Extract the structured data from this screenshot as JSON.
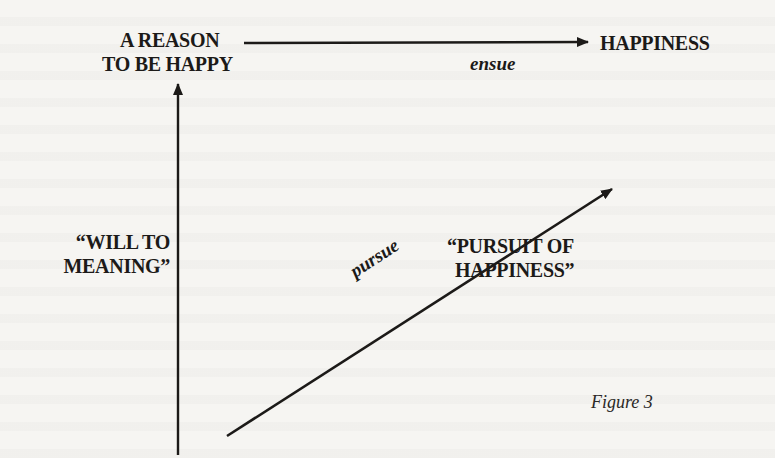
{
  "diagram": {
    "nodes": {
      "reason": {
        "line1": "A REASON",
        "line2": "TO BE HAPPY"
      },
      "happiness": {
        "label": "HAPPINESS"
      },
      "will_to_meaning": {
        "line1": "“WILL TO",
        "line2": "MEANING”"
      },
      "pursuit_of_happiness": {
        "line1": "“PURSUIT OF",
        "line2": "HAPPINESS”"
      }
    },
    "edges": {
      "ensue": {
        "label": "ensue",
        "from": "A REASON TO BE HAPPY",
        "to": "HAPPINESS"
      },
      "pursue": {
        "label": "pursue",
        "from": "origin",
        "to": "HAPPINESS"
      },
      "will": {
        "label": "",
        "from": "origin",
        "to": "A REASON TO BE HAPPY"
      }
    },
    "caption": "Figure 3",
    "colors": {
      "ink": "#1c1a18",
      "paper": "#f6f5f2"
    }
  }
}
